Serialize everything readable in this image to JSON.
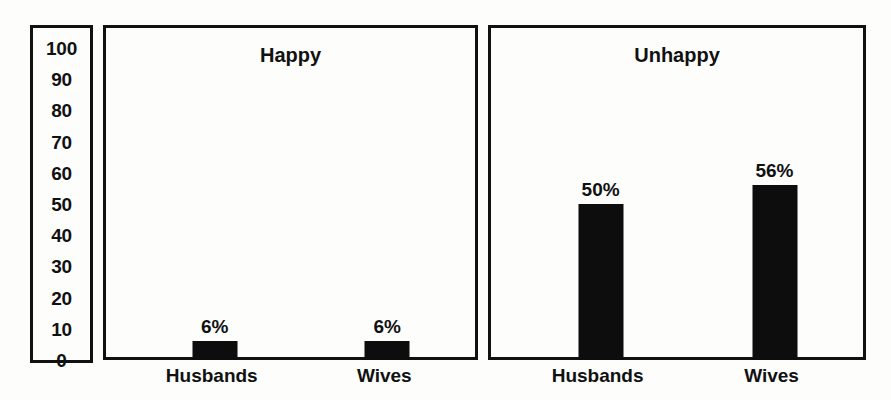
{
  "chart_data": {
    "type": "bar",
    "title": "",
    "xlabel": "",
    "ylabel": "",
    "ylim": [
      0,
      100
    ],
    "y_ticks": [
      "100",
      "90",
      "80",
      "70",
      "60",
      "50",
      "40",
      "30",
      "20",
      "10",
      "0"
    ],
    "grid": false,
    "legend_position": "none",
    "value_suffix": "%",
    "categories": [
      "Husbands",
      "Wives"
    ],
    "panels": [
      {
        "label": "Happy",
        "bars": [
          {
            "category": "Husbands",
            "value": 6,
            "value_label": "6%"
          },
          {
            "category": "Wives",
            "value": 6,
            "value_label": "6%"
          }
        ]
      },
      {
        "label": "Unhappy",
        "bars": [
          {
            "category": "Husbands",
            "value": 50,
            "value_label": "50%"
          },
          {
            "category": "Wives",
            "value": 56,
            "value_label": "56%"
          }
        ]
      }
    ],
    "series": [
      {
        "name": "Happy",
        "values": [
          6,
          6
        ]
      },
      {
        "name": "Unhappy",
        "values": [
          50,
          56
        ]
      }
    ]
  },
  "colors": {
    "bar": "#0d0d0d",
    "border": "#111111",
    "background": "#fdfdfc",
    "text": "#111111"
  }
}
